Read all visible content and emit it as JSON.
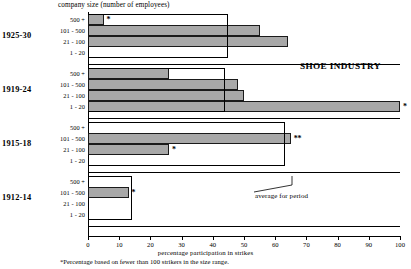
{
  "chart_data": {
    "type": "bar",
    "orientation": "horizontal",
    "title": "SHOE INDUSTRY",
    "xlabel": "percentage participation in strikes",
    "ylabel": "company size (number of employees)",
    "xlim": [
      0,
      100
    ],
    "xticks": [
      0,
      10,
      20,
      30,
      40,
      50,
      60,
      70,
      80,
      90,
      100
    ],
    "xticklabels": [
      "0",
      "10",
      "20",
      "30",
      "40",
      "50",
      "60",
      "70",
      "80",
      "90",
      "100"
    ],
    "grid": false,
    "legend": "none",
    "categories": [
      "500 +",
      "101 - 500",
      "21 - 100",
      "1 - 20"
    ],
    "groups": [
      {
        "period": "1925-30",
        "average_for_period": 45,
        "bars": [
          {
            "category": "500 +",
            "value": 5,
            "note": "*"
          },
          {
            "category": "101 - 500",
            "value": 55,
            "note": ""
          },
          {
            "category": "21 - 100",
            "value": 64,
            "note": ""
          },
          {
            "category": "1 - 20",
            "value": 0,
            "note": ""
          }
        ]
      },
      {
        "period": "1919-24",
        "average_for_period": 44,
        "bars": [
          {
            "category": "500 +",
            "value": 26,
            "note": ""
          },
          {
            "category": "101 - 500",
            "value": 48,
            "note": ""
          },
          {
            "category": "21 - 100",
            "value": 50,
            "note": ""
          },
          {
            "category": "1 - 20",
            "value": 100,
            "note": "*"
          }
        ]
      },
      {
        "period": "1915-18",
        "average_for_period": 63,
        "bars": [
          {
            "category": "500 +",
            "value": 0,
            "note": ""
          },
          {
            "category": "101 - 500",
            "value": 65,
            "note": "**"
          },
          {
            "category": "21 - 100",
            "value": 26,
            "note": "*"
          },
          {
            "category": "1 - 20",
            "value": 0,
            "note": ""
          }
        ]
      },
      {
        "period": "1912-14",
        "average_for_period": 14,
        "bars": [
          {
            "category": "500 +",
            "value": 0,
            "note": ""
          },
          {
            "category": "101 - 500",
            "value": 13,
            "note": "*"
          },
          {
            "category": "21 - 100",
            "value": 0,
            "note": ""
          },
          {
            "category": "1 - 20",
            "value": 0,
            "note": ""
          }
        ]
      }
    ],
    "annotations": [
      {
        "name": "average-for-period",
        "text": "average for period"
      }
    ],
    "footnote": "*Percentage based on fewer than 100 strikers in the size range.",
    "colors": {
      "bar_fill": "#a8a8a8",
      "bar_stroke": "#1a1a1a",
      "axis": "#000000",
      "background": "#ffffff"
    }
  }
}
